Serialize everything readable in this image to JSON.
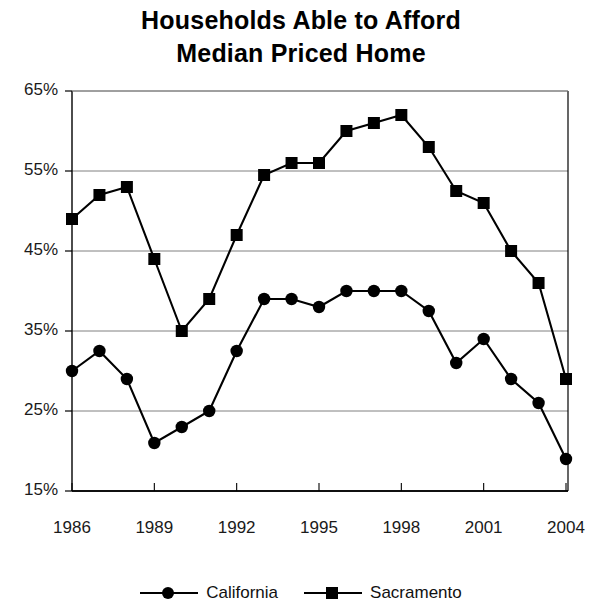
{
  "chart_data": {
    "type": "line",
    "title": "Households Able to Afford Median Priced Home",
    "title_line1": "Households Able to Afford",
    "title_line2": "Median Priced Home",
    "xlabel": "",
    "ylabel": "",
    "x": [
      1986,
      1987,
      1988,
      1989,
      1990,
      1991,
      1992,
      1993,
      1994,
      1995,
      1996,
      1997,
      1998,
      1999,
      2000,
      2001,
      2002,
      2003,
      2004
    ],
    "xtick_labels": [
      "1986",
      "1989",
      "1992",
      "1995",
      "1998",
      "2001",
      "2004"
    ],
    "xtick_values": [
      1986,
      1989,
      1992,
      1995,
      1998,
      2001,
      2004
    ],
    "ytick_labels": [
      "65%",
      "55%",
      "45%",
      "35%",
      "25%",
      "15%"
    ],
    "ytick_values": [
      65,
      55,
      45,
      35,
      25,
      15
    ],
    "ylim": [
      15,
      65
    ],
    "xlim": [
      1986,
      2004
    ],
    "grid": true,
    "grid_axis": "y",
    "legend_position": "bottom",
    "series": [
      {
        "name": "California",
        "marker": "circle",
        "color": "#000000",
        "values": [
          30,
          32.5,
          29,
          21,
          23,
          25,
          32.5,
          39,
          39,
          38,
          40,
          40,
          40,
          37.5,
          31,
          34,
          29,
          26,
          19
        ]
      },
      {
        "name": "Sacramento",
        "marker": "square",
        "color": "#000000",
        "values": [
          49,
          52,
          53,
          44,
          35,
          39,
          47,
          54.5,
          56,
          56,
          60,
          61,
          62,
          58,
          52.5,
          51,
          45,
          41,
          29
        ]
      }
    ]
  },
  "legend": {
    "entries": [
      {
        "label": "California",
        "marker": "circle-marker-icon"
      },
      {
        "label": "Sacramento",
        "marker": "square-marker-icon"
      }
    ]
  }
}
